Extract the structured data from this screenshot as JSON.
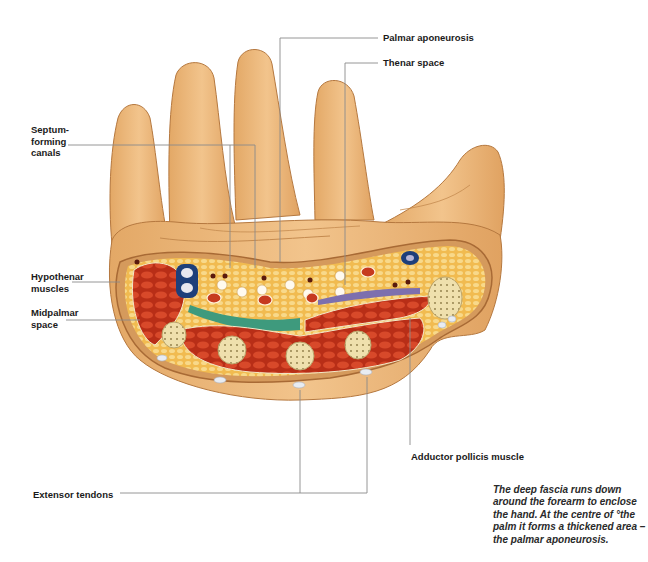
{
  "figure": {
    "colors": {
      "skin": "#e9b477",
      "skin_shadow": "#c9894a",
      "muscle": "#c63a1f",
      "fat": "#f3c35c",
      "bone": "#efe0ad",
      "midpalmar_space": "#3e9a7d",
      "thenar_space": "#7d6fae",
      "vessel_blue": "#1d3f7a",
      "leader_line": "#8a8a8a"
    }
  },
  "labels": {
    "palmar_aponeurosis": "Palmar aponeurosis",
    "thenar_space": "Thenar space",
    "septum_forming_canals": "Septum-\nforming\ncanals",
    "hypothenar_muscles": "Hypothenar\nmuscles",
    "midpalmar_space": "Midpalmar\nspace",
    "adductor_pollicis_muscle": "Adductor pollicis muscle",
    "extensor_tendons": "Extensor tendons"
  },
  "caption": "The deep fascia runs down around the forearm to enclose the hand. At the centre of °the palm it forms a thickened area – the palmar aponeurosis."
}
